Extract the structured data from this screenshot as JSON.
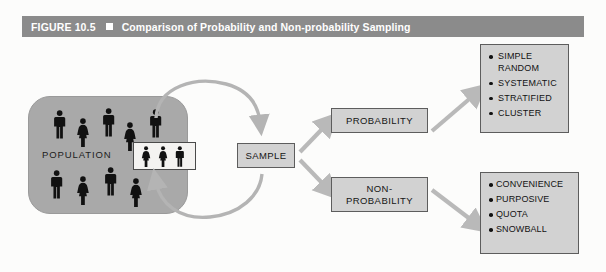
{
  "figure": {
    "number_label": "FIGURE 10.5",
    "separator_icon": "filled-square-bullet",
    "title": "Comparison of Probability and Non-probability Sampling",
    "header_bg": "#8b8b8b",
    "header_text_color": "#ffffff"
  },
  "population": {
    "label": "POPULATION",
    "fill": "#a9a9a9",
    "figures": [
      {
        "type": "male",
        "x": 25,
        "y": 14
      },
      {
        "type": "female",
        "x": 48,
        "y": 22
      },
      {
        "type": "male",
        "x": 74,
        "y": 12
      },
      {
        "type": "female",
        "x": 95,
        "y": 26
      },
      {
        "type": "male",
        "x": 121,
        "y": 13
      },
      {
        "type": "male",
        "x": 22,
        "y": 74
      },
      {
        "type": "female",
        "x": 48,
        "y": 80
      },
      {
        "type": "male",
        "x": 76,
        "y": 71
      },
      {
        "type": "female",
        "x": 101,
        "y": 82
      }
    ]
  },
  "sample_inset": {
    "name": "sample-selection-inset",
    "fill": "#f4f3f1",
    "figures": [
      {
        "type": "female",
        "x": 7
      },
      {
        "type": "female",
        "x": 24
      },
      {
        "type": "male",
        "x": 41
      }
    ]
  },
  "boxes": {
    "sample": "SAMPLE",
    "probability": "PROBABILITY",
    "nonprobability_line1": "NON-",
    "nonprobability_line2": "PROBABILITY",
    "fill": "#d2d2d2",
    "border": "#5d5d5d"
  },
  "lists": {
    "probability_types": [
      "SIMPLE RANDOM",
      "SYSTEMATIC",
      "STRATIFIED",
      "CLUSTER"
    ],
    "nonprobability_types": [
      "CONVENIENCE",
      "PURPOSIVE",
      "QUOTA",
      "SNOWBALL"
    ],
    "bullet_icon": "round-bullet"
  },
  "arrows": {
    "color": "#b4b4b4",
    "branch_color": "#b9b9b9",
    "loop_description": "bidirectional loop between population and sample",
    "items": [
      {
        "name": "population-to-sample-arrow",
        "from": "population",
        "to": "sample"
      },
      {
        "name": "sample-to-population-arrow",
        "from": "sample",
        "to": "population"
      },
      {
        "name": "sample-to-probability-arrow",
        "from": "sample",
        "to": "probability"
      },
      {
        "name": "sample-to-nonprobability-arrow",
        "from": "sample",
        "to": "nonprobability"
      },
      {
        "name": "probability-to-types-arrow",
        "from": "probability",
        "to": "probability-types"
      },
      {
        "name": "nonprobability-to-types-arrow",
        "from": "nonprobability",
        "to": "nonprobability-types"
      }
    ]
  }
}
